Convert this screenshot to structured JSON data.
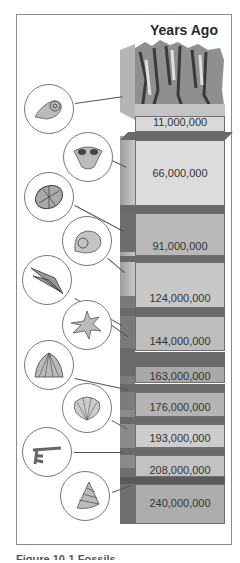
{
  "diagram": {
    "title": "Years Ago",
    "layers": [
      {
        "label": "11,000,000",
        "fossil": "ammonite-coiled-shell",
        "color": "#d9d9d9"
      },
      {
        "label": "66,000,000",
        "fossil": "brachiopod-shell",
        "color": "#dcdcdc"
      },
      {
        "label": "91,000,000",
        "fossil": "sea-urchin",
        "color": "#b9b9b9"
      },
      {
        "label": "124,000,000",
        "fossil": "nautilus-shell",
        "color": "#c8c8c8"
      },
      {
        "label": "144,000,000",
        "fossil": "belemnite",
        "color": "#bdbdbd"
      },
      {
        "label": "163,000,000",
        "fossil": "spiny-gastropod",
        "color": "#a9a9a9"
      },
      {
        "label": "176,000,000",
        "fossil": "fan-shell",
        "color": "#b4b4b4"
      },
      {
        "label": "193,000,000",
        "fossil": "scallop-shell",
        "color": "#cdcdcd"
      },
      {
        "label": "208,000,000",
        "fossil": "crinoid-fragment",
        "color": "#c2c2c2"
      },
      {
        "label": "240,000,000",
        "fossil": "spiral-gastropod",
        "color": "#adadad"
      }
    ]
  },
  "caption": "Figure 10-1 Fossils"
}
